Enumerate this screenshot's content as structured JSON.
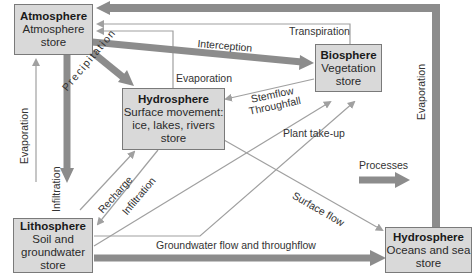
{
  "stores": {
    "atmosphere": {
      "title": "Atmosphere",
      "line1": "Atmosphere",
      "line2": "store"
    },
    "biosphere": {
      "title": "Biosphere",
      "line1": "Vegetation",
      "line2": "store"
    },
    "hydro_surface": {
      "title": "Hydrosphere",
      "line1": "Surface movement:",
      "line2": "ice, lakes, rivers",
      "line3": "store"
    },
    "lithosphere": {
      "title": "Lithosphere",
      "line1": "Soil and",
      "line2": "groundwater",
      "line3": "store"
    },
    "hydro_ocean": {
      "title": "Hydrosphere",
      "line1": "Oceans and sea",
      "line2": "store"
    }
  },
  "flows": {
    "transpiration": "Transpiration",
    "interception": "Interception",
    "evaporation_surface": "Evaporation",
    "precipitation": "Precipitation",
    "stemflow": "Stemflow",
    "throughfall": "Throughfall",
    "plant_takeup": "Plant take-up",
    "evaporation_soil": "Evaporation",
    "infiltration_main": "Infiltration",
    "recharge": "Recharge",
    "infiltration_surface": "Infiltration",
    "surface_flow": "Surface flow",
    "groundwater": "Groundwater flow and throughflow",
    "evaporation_ocean": "Evaporation"
  },
  "legend": {
    "label": "Processes"
  },
  "colors": {
    "thick_arrow": "#8c8c8c",
    "thin_arrow": "#a0a0a0",
    "box_fill": "#d9d9d9",
    "box_border": "#7a7a7a"
  }
}
